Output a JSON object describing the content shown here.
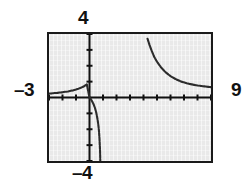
{
  "figure": {
    "caption_labels": {
      "ymax": "4",
      "ymin": "–4",
      "xmin": "–3",
      "xmax": "9"
    },
    "frame_color": "#1a1a1a",
    "plot_background": "#e9e9e9",
    "curve_color": "#2b2b2b"
  },
  "chart_data": {
    "type": "line",
    "title": "",
    "xlabel": "",
    "ylabel": "",
    "xlim": [
      -3,
      9
    ],
    "ylim": [
      -4,
      4
    ],
    "grid": false,
    "legend": "none",
    "axes": {
      "x_axis_at_y": 0,
      "y_axis_at_x": 0,
      "x_tick_spacing": 1,
      "y_tick_spacing": 1,
      "x_ticks": [
        -3,
        -2,
        -1,
        0,
        1,
        2,
        3,
        4,
        5,
        6,
        7,
        8,
        9
      ],
      "y_ticks": [
        -4,
        -3,
        -2,
        -1,
        0,
        1,
        2,
        3,
        4
      ],
      "tick_labels_shown": false
    },
    "annotations": [
      "Window corner labels: x from –3 to 9, y from –4 to 4",
      "Rational function with vertical asymptote near x = 1 and horizontal asymptote y = 0"
    ],
    "series": [
      {
        "name": "left-branch",
        "description": "Branch approaching horizontal asymptote y = 0 from above on the far left, then falling steeply to –4 near the vertical asymptote",
        "x": [
          -3.0,
          -2.8,
          -2.6,
          -2.4,
          -2.2,
          -2.0,
          -1.8,
          -1.6,
          -1.4,
          -1.2,
          -1.0,
          -0.8,
          -0.6,
          -0.4,
          -0.2,
          0.0,
          0.1,
          0.2,
          0.3,
          0.4,
          0.5,
          0.6,
          0.65,
          0.7,
          0.74,
          0.78,
          0.8
        ],
        "y": [
          0.25,
          0.26,
          0.28,
          0.29,
          0.31,
          0.33,
          0.36,
          0.38,
          0.42,
          0.45,
          0.5,
          0.56,
          0.63,
          0.71,
          0.83,
          0.0,
          -0.1,
          -0.25,
          -0.42,
          -0.65,
          -0.95,
          -1.4,
          -1.7,
          -2.1,
          -2.6,
          -3.3,
          -4.0
        ]
      },
      {
        "name": "right-branch",
        "description": "Branch descending from top of window toward horizontal asymptote y = 0 on the right",
        "x": [
          4.3,
          4.45,
          4.6,
          4.8,
          5.0,
          5.3,
          5.6,
          6.0,
          6.4,
          6.8,
          7.2,
          7.6,
          8.0,
          8.4,
          8.8,
          9.0
        ],
        "y": [
          3.7,
          3.3,
          2.95,
          2.55,
          2.25,
          1.9,
          1.62,
          1.35,
          1.15,
          1.0,
          0.9,
          0.82,
          0.76,
          0.71,
          0.67,
          0.65
        ]
      }
    ]
  }
}
